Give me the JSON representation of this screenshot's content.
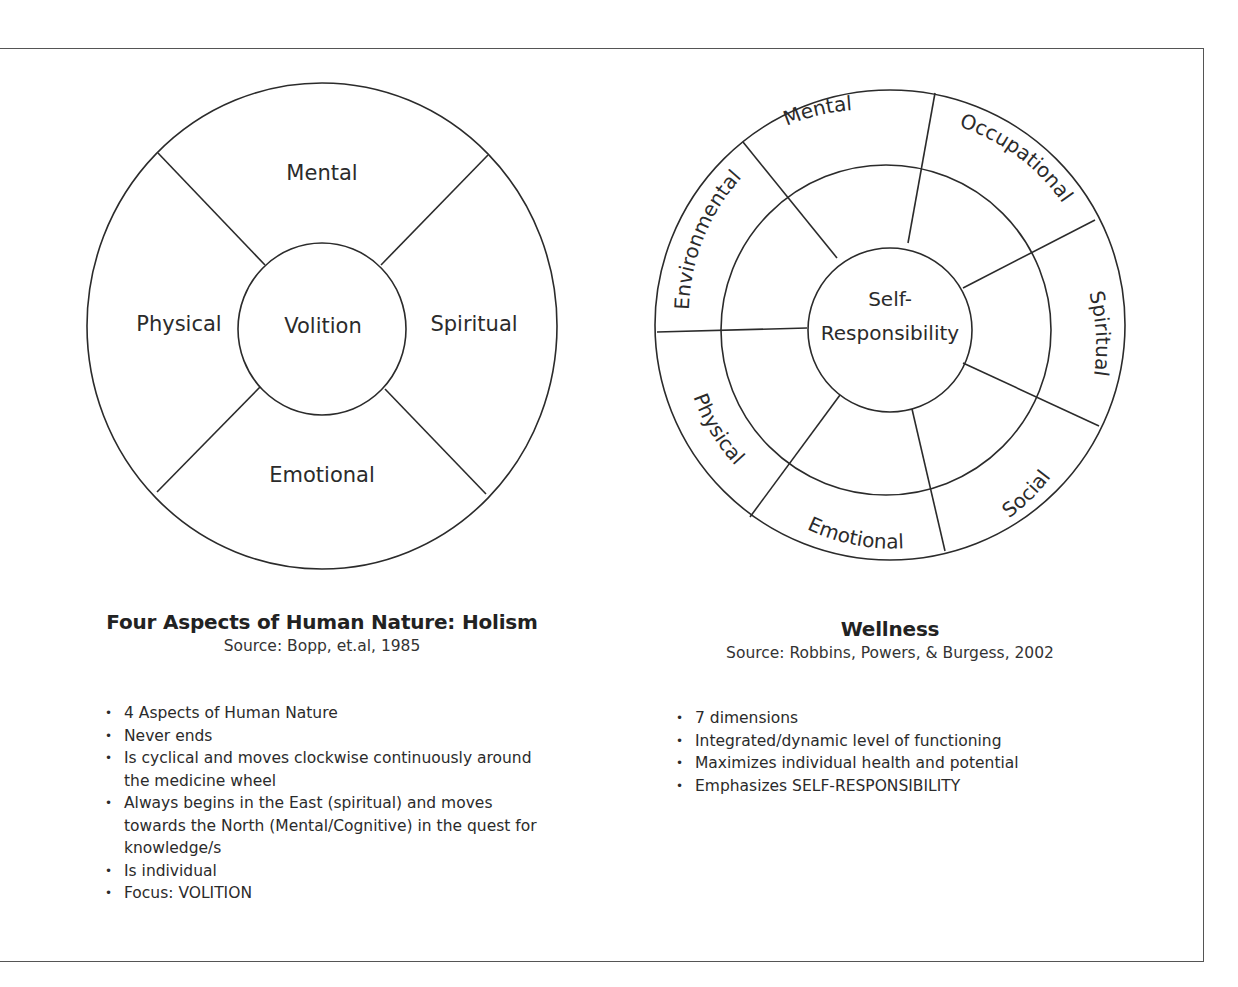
{
  "holism": {
    "wheel": {
      "center_label": "Volition",
      "segments": {
        "top": "Mental",
        "left": "Physical",
        "right": "Spiritual",
        "bottom": "Emotional"
      }
    },
    "title": "Four Aspects of Human Nature: Holism",
    "source": "Source: Bopp, et.al, 1985",
    "bullets": [
      "4 Aspects of Human Nature",
      "Never ends",
      "Is cyclical and moves clockwise  continuously around the medicine wheel",
      "Always begins in the East (spiritual) and moves towards the North (Mental/Cognitive) in the quest for knowledge/s",
      "Is individual",
      "Focus:  VOLITION"
    ]
  },
  "wellness": {
    "wheel": {
      "center_label_line1": "Self-",
      "center_label_line2": "Responsibility",
      "dimensions": [
        "Mental",
        "Occupational",
        "Spiritual",
        "Social",
        "Emotional",
        "Physical",
        "Environmental"
      ]
    },
    "title": "Wellness",
    "source": "Source: Robbins, Powers, & Burgess, 2002",
    "bullets": [
      "7 dimensions",
      "Integrated/dynamic level of functioning",
      "Maximizes individual health and potential",
      "Emphasizes SELF-RESPONSIBILITY"
    ]
  },
  "colors": {
    "line": "#2b2b2b",
    "frame": "#555555",
    "background": "#ffffff"
  }
}
